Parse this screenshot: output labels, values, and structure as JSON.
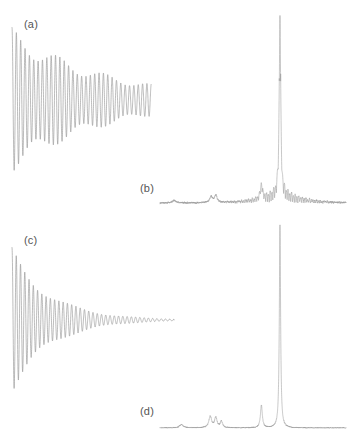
{
  "figure": {
    "kind": "nmr-fid-and-spectrum-figure",
    "background_color": "#ffffff",
    "trace_color": "#8e8e8e",
    "label_color": "#555555",
    "panels": [
      {
        "id": "a",
        "label": "(a)",
        "kind": "fid",
        "label_x": 24,
        "label_y": 18
      },
      {
        "id": "b",
        "label": "(b)",
        "kind": "spectrum",
        "label_x": 140,
        "label_y": 182
      },
      {
        "id": "c",
        "label": "(c)",
        "kind": "fid",
        "label_x": 24,
        "label_y": 234
      },
      {
        "id": "d",
        "label": "(d)",
        "kind": "spectrum",
        "label_x": 140,
        "label_y": 405
      }
    ]
  },
  "chart_data": [
    {
      "id": "a",
      "type": "line",
      "title": "(a)",
      "description": "Truncated free induction decay: damped oscillation with beat modulation, cut off abruptly while amplitude is still large.",
      "xlabel": "",
      "ylabel": "",
      "grid": false,
      "legend": null,
      "axes_visible": false,
      "plot_box": {
        "x": 12,
        "y": 30,
        "width": 148,
        "height": 145
      },
      "baseline_y": 100,
      "xlim": [
        0,
        1
      ],
      "ylim": [
        -1,
        1
      ],
      "signal": {
        "model": "damped_beating_cosine",
        "amplitude": 1.0,
        "decay_constant": 1.6,
        "carrier_cycles": 34,
        "beat_cycles": 3.2,
        "beat_depth": 0.3,
        "truncated": true,
        "truncation_fraction": 0.94,
        "amplitude_at_truncation": 0.31
      }
    },
    {
      "id": "b",
      "type": "line",
      "title": "(b)",
      "description": "Fourier transform of the truncated FID: dominant peak flanked by strong sinc truncation wiggles (ringing) at the base.",
      "xlabel": "",
      "ylabel": "",
      "grid": false,
      "legend": null,
      "axes_visible": false,
      "plot_box": {
        "x": 160,
        "y": 12,
        "width": 186,
        "height": 196
      },
      "baseline_y": 203,
      "xlim": [
        0,
        1
      ],
      "ylim": [
        0,
        1
      ],
      "peaks": [
        {
          "position": 0.075,
          "height": 0.012,
          "width": 0.012,
          "name": "noise-bump"
        },
        {
          "position": 0.275,
          "height": 0.03,
          "width": 0.009,
          "name": "small-multiplet-left"
        },
        {
          "position": 0.3,
          "height": 0.038,
          "width": 0.008,
          "name": "small-multiplet-right"
        },
        {
          "position": 0.545,
          "height": 0.075,
          "width": 0.007,
          "name": "satellite-peak"
        },
        {
          "position": 0.645,
          "height": 0.96,
          "width": 0.0045,
          "name": "main-peak"
        }
      ],
      "ringing": {
        "present": true,
        "center": 0.645,
        "amplitude": 0.085,
        "frequency": 52,
        "decay": 9
      },
      "noise_level": 0.006
    },
    {
      "id": "c",
      "type": "line",
      "title": "(c)",
      "description": "Fully relaxed free induction decay: the same oscillation allowed to decay smoothly to zero before acquisition ends.",
      "xlabel": "",
      "ylabel": "",
      "grid": false,
      "legend": null,
      "axes_visible": false,
      "plot_box": {
        "x": 12,
        "y": 248,
        "width": 162,
        "height": 145
      },
      "baseline_y": 320,
      "xlim": [
        0,
        1
      ],
      "ylim": [
        -1,
        1
      ],
      "signal": {
        "model": "damped_beating_cosine",
        "amplitude": 1.0,
        "decay_constant": 4.2,
        "carrier_cycles": 38,
        "beat_cycles": 2.6,
        "beat_depth": 0.22,
        "truncated": false,
        "truncation_fraction": 1.0,
        "amplitude_at_truncation": 0.0
      }
    },
    {
      "id": "d",
      "type": "line",
      "title": "(d)",
      "description": "Fourier transform of the fully decayed FID: clean narrow lines with a flat baseline and no truncation ringing.",
      "xlabel": "",
      "ylabel": "",
      "grid": false,
      "legend": null,
      "axes_visible": false,
      "plot_box": {
        "x": 160,
        "y": 222,
        "width": 186,
        "height": 208
      },
      "baseline_y": 428,
      "xlim": [
        0,
        1
      ],
      "ylim": [
        0,
        1
      ],
      "peaks": [
        {
          "position": 0.115,
          "height": 0.016,
          "width": 0.013,
          "name": "noise-bump"
        },
        {
          "position": 0.27,
          "height": 0.055,
          "width": 0.009,
          "name": "small-multiplet-left"
        },
        {
          "position": 0.3,
          "height": 0.048,
          "width": 0.008,
          "name": "small-multiplet-mid"
        },
        {
          "position": 0.33,
          "height": 0.03,
          "width": 0.008,
          "name": "small-multiplet-right"
        },
        {
          "position": 0.545,
          "height": 0.11,
          "width": 0.006,
          "name": "satellite-peak"
        },
        {
          "position": 0.645,
          "height": 0.975,
          "width": 0.004,
          "name": "main-peak"
        }
      ],
      "ringing": {
        "present": false,
        "center": 0.645,
        "amplitude": 0.0,
        "frequency": 0,
        "decay": 0
      },
      "noise_level": 0.004
    }
  ]
}
